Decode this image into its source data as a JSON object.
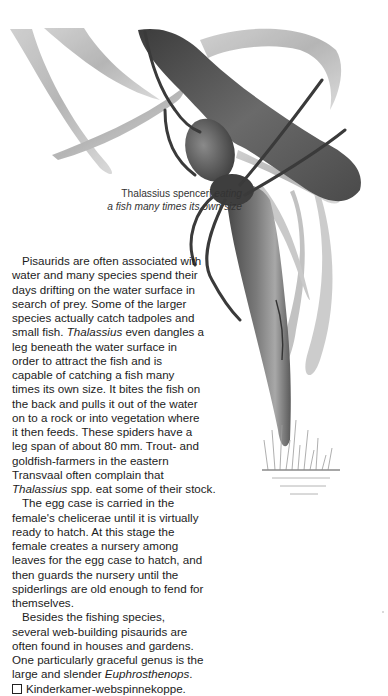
{
  "caption": {
    "species": "Thalassius spenceri",
    "line1_rest": "eating",
    "line2": "a fish many times its own size"
  },
  "illustration": {
    "subject": "Fishing spider eating a fish",
    "elements": [
      "grass-blades",
      "spider",
      "fish",
      "reed-grass-tuft",
      "water-surface"
    ]
  },
  "body": {
    "lines": [
      {
        "text": "Pisaurids are often associated with",
        "indent": true
      },
      {
        "text": "water and many species spend their"
      },
      {
        "text": "days drifting on the water surface in"
      },
      {
        "text": "search of prey. Some of the larger"
      },
      {
        "text": "species actually catch tadpoles and"
      },
      {
        "pre": "small fish. ",
        "italic": "Thalassius",
        "post": " even dangles a"
      },
      {
        "text": "leg beneath the water surface in"
      },
      {
        "text": "order to attract the fish and is"
      },
      {
        "text": "capable of catching a fish many"
      },
      {
        "text": "times its own size. It bites the fish on"
      },
      {
        "text": "the back and pulls it out of the water"
      },
      {
        "text": "on to a rock or into vegetation where"
      },
      {
        "text": "it then feeds. These spiders have a"
      },
      {
        "text": "leg span of about 80 mm. Trout- and"
      },
      {
        "text": "goldfish-farmers in the eastern"
      },
      {
        "text": "Transvaal often complain that"
      },
      {
        "pre": "",
        "italic": "Thalassius",
        "post": " spp. eat some of their stock."
      },
      {
        "text": "The egg case is carried in the",
        "indent": true
      },
      {
        "text": "female's chelicerae until it is virtually"
      },
      {
        "text": "ready to hatch. At this stage the"
      },
      {
        "text": "female creates a nursery among"
      },
      {
        "text": "leaves for the egg case to hatch, and"
      },
      {
        "text": "then guards the nursery until the"
      },
      {
        "text": "spiderlings are old enough to fend for"
      },
      {
        "text": "themselves."
      },
      {
        "text": "Besides the fishing species,",
        "indent": true
      },
      {
        "text": "several web-building pisaurids are"
      },
      {
        "text": "often found in houses and gardens."
      },
      {
        "text": "One particularly graceful genus is the"
      },
      {
        "pre": "large and slender ",
        "italic": "Euphrosthenops",
        "post": "."
      }
    ],
    "common_name": "Kinderkamer-webspinnekoppe."
  }
}
